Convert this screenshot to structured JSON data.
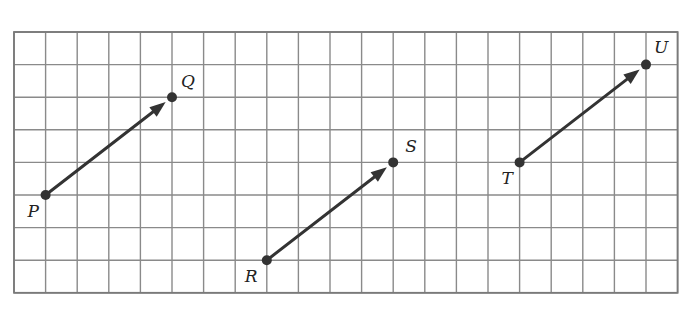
{
  "diagram": {
    "type": "grid-vectors",
    "grid": {
      "columns": 21,
      "rows": 8,
      "origin_px": [
        14,
        32
      ],
      "cell_w": 31.6,
      "cell_h": 32.6,
      "line_color": "#8a8a8a",
      "border_color": "#7a7a7a"
    },
    "vector_color": "#333333",
    "vectors": [
      {
        "from": {
          "label": "P",
          "col": 1,
          "row": 5,
          "label_dx": -18,
          "label_dy": 22
        },
        "to": {
          "label": "Q",
          "col": 5,
          "row": 2,
          "label_dx": 9,
          "label_dy": -10
        }
      },
      {
        "from": {
          "label": "R",
          "col": 8,
          "row": 7,
          "label_dx": -22,
          "label_dy": 22
        },
        "to": {
          "label": "S",
          "col": 12,
          "row": 4,
          "label_dx": 12,
          "label_dy": -10
        }
      },
      {
        "from": {
          "label": "T",
          "col": 16,
          "row": 4,
          "label_dx": -18,
          "label_dy": 22
        },
        "to": {
          "label": "U",
          "col": 20,
          "row": 1,
          "label_dx": 8,
          "label_dy": -12
        }
      }
    ]
  }
}
